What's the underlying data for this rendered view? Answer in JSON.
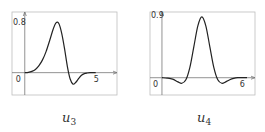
{
  "chart_data": [
    {
      "type": "line",
      "title": "u3",
      "caption_base": "u",
      "caption_sub": "3",
      "xlabel": "",
      "ylabel": "",
      "xlim": [
        -0.9,
        6.5
      ],
      "ylim": [
        -0.35,
        0.95
      ],
      "x_tick_labels": [
        "0",
        "5"
      ],
      "x_ticks": [
        0,
        5
      ],
      "y_tick_labels": [
        "0.8"
      ],
      "y_ticks": [
        0.8
      ],
      "grid": false,
      "series": [
        {
          "name": "u3",
          "x": [
            0,
            0.25,
            0.5,
            0.75,
            1.0,
            1.25,
            1.5,
            1.75,
            2.0,
            2.2,
            2.4,
            2.6,
            2.8,
            3.0,
            3.2,
            3.4,
            3.6,
            3.8,
            4.0,
            4.2,
            4.4,
            4.6,
            4.8,
            5.0
          ],
          "y": [
            0,
            0.005,
            0.02,
            0.05,
            0.11,
            0.2,
            0.33,
            0.5,
            0.68,
            0.78,
            0.77,
            0.62,
            0.38,
            0.1,
            -0.1,
            -0.18,
            -0.15,
            -0.09,
            -0.04,
            -0.015,
            -0.005,
            0,
            0,
            0
          ]
        }
      ]
    },
    {
      "type": "line",
      "title": "u4",
      "caption_base": "u",
      "caption_sub": "4",
      "xlabel": "",
      "ylabel": "",
      "xlim": [
        -0.9,
        7.0
      ],
      "ylim": [
        -0.25,
        0.95
      ],
      "x_tick_labels": [
        "0",
        "6"
      ],
      "x_ticks": [
        0,
        6
      ],
      "y_tick_labels": [
        "0.9"
      ],
      "y_ticks": [
        0.9
      ],
      "grid": false,
      "series": [
        {
          "name": "u4",
          "x": [
            0,
            0.4,
            0.8,
            1.2,
            1.5,
            1.8,
            2.1,
            2.4,
            2.7,
            3.0,
            3.3,
            3.6,
            3.9,
            4.2,
            4.5,
            4.8,
            5.1,
            5.4,
            5.7,
            6.0,
            6.4
          ],
          "y": [
            0,
            -0.005,
            -0.02,
            -0.06,
            -0.08,
            -0.03,
            0.15,
            0.45,
            0.75,
            0.88,
            0.75,
            0.45,
            0.15,
            -0.03,
            -0.08,
            -0.06,
            -0.03,
            -0.01,
            0,
            0,
            0
          ]
        }
      ]
    }
  ]
}
